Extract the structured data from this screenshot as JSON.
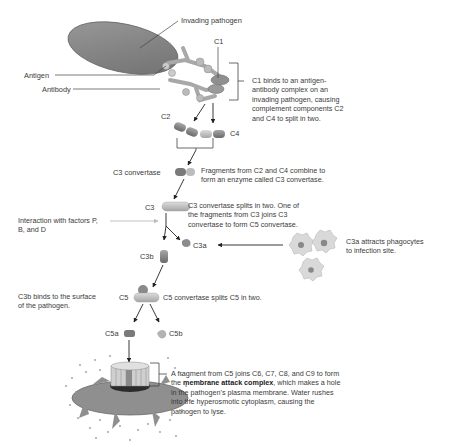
{
  "labels": {
    "invading_pathogen": "Invading pathogen",
    "antigen": "Antigen",
    "antibody": "Antibody",
    "c1": "C1",
    "c2": "C2",
    "c4": "C4",
    "c3_convertase": "C3 convertase",
    "c3": "C3",
    "c3a": "C3a",
    "c3b": "C3b",
    "c5": "C5",
    "c5a": "C5a",
    "c5b": "C5b",
    "interaction_line1": "Interaction with factors P,",
    "interaction_line2": "B, and D"
  },
  "steps": {
    "c1_binds": [
      "C1 binds to an antigen-",
      "antibody complex on an",
      "invading pathogen, causing",
      "complement components C2",
      "and C4 to split in two."
    ],
    "fragments": [
      "Fragments from C2 and C4 combine to",
      "form an enzyme called C3 convertase."
    ],
    "c3_splits": [
      "C3 convertase splits in two. One of",
      "the fragments from C3 joins C3",
      "convertase to form C5 convertase."
    ],
    "c3a_attracts": [
      "C3a attracts phagocytes",
      "to infection site."
    ],
    "c3b_binds": [
      "C3b binds to the surface",
      "of the pathogen."
    ],
    "c5_splits": "C5 convertase splits C5 in two.",
    "mac": {
      "line1": "A fragment  from C5 joins C6, C7, C8, and C9 to form",
      "line2_pre": "the ",
      "line2_bold": "membrane attack complex",
      "line2_post": ", which makes a hole",
      "line3": "in the pathogen's plasma membrane. Water rushes",
      "line4": "into the hyperosmotic cytoplasm, causing the",
      "line5": "pathogen to lyse."
    }
  },
  "colors": {
    "pathogen": "#8a8a8a",
    "antibody": "#b5b5b5",
    "fragment_dark": "#7d7d7d",
    "fragment_light": "#c4c4c4",
    "arrow": "#222222",
    "interaction_arrow": "#bdbdbd"
  }
}
